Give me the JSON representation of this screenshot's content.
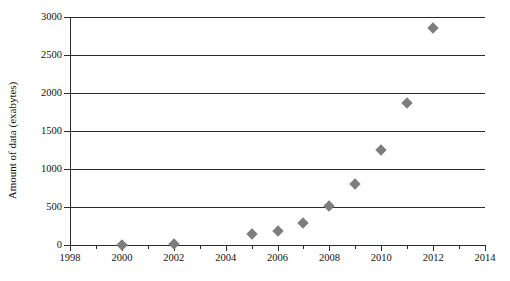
{
  "chart_data": {
    "type": "scatter",
    "title": "",
    "xlabel": "",
    "ylabel": "Amount of data (exabytes)",
    "xlim": [
      1998,
      2014
    ],
    "ylim": [
      0,
      3000
    ],
    "grid": true,
    "grid_axis": "y",
    "legend": false,
    "marker": {
      "shape": "diamond",
      "color": "#7d7d7d",
      "size": 8
    },
    "axis_color": "#2a2a2a",
    "x": [
      2000,
      2002,
      2005,
      2006,
      2007,
      2008,
      2009,
      2010,
      2011,
      2012
    ],
    "values": [
      5,
      10,
      150,
      180,
      290,
      510,
      800,
      1250,
      1870,
      2860
    ],
    "points": [
      {
        "x": 2000,
        "y": 5
      },
      {
        "x": 2002,
        "y": 10
      },
      {
        "x": 2005,
        "y": 150
      },
      {
        "x": 2006,
        "y": 180
      },
      {
        "x": 2007,
        "y": 290
      },
      {
        "x": 2008,
        "y": 510
      },
      {
        "x": 2009,
        "y": 800
      },
      {
        "x": 2010,
        "y": 1250
      },
      {
        "x": 2011,
        "y": 1870
      },
      {
        "x": 2012,
        "y": 2860
      }
    ],
    "yticks": [
      0,
      500,
      1000,
      1500,
      2000,
      2500,
      3000
    ],
    "ytick_labels": [
      "0",
      "500",
      "1000",
      "1500",
      "2000",
      "2500",
      "3000"
    ],
    "xticks": [
      1998,
      2000,
      2002,
      2004,
      2006,
      2008,
      2010,
      2012,
      2014
    ],
    "xtick_labels": [
      "1998",
      "2000",
      "2002",
      "2004",
      "2006",
      "2008",
      "2010",
      "2012",
      "2014"
    ],
    "xticks_minor": [
      1999,
      2001,
      2003,
      2005,
      2007,
      2009,
      2011,
      2013
    ]
  }
}
